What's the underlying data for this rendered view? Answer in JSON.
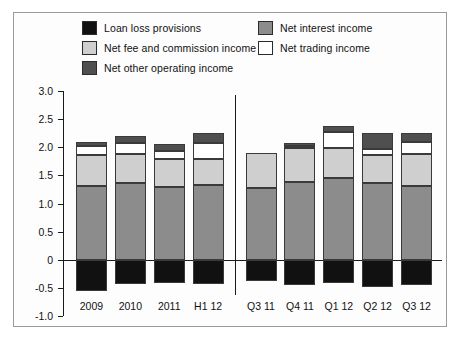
{
  "chart_data": {
    "type": "bar",
    "subtype": "stacked-bar-with-negative",
    "title": "",
    "xlabel": "",
    "ylabel": "",
    "ylim": [
      -1.0,
      3.0
    ],
    "yticks": [
      "3.0",
      "2.5",
      "2.0",
      "1.5",
      "1.0",
      "0.5",
      "0",
      "-0.5",
      "-1.0"
    ],
    "ytick_values": [
      3.0,
      2.5,
      2.0,
      1.5,
      1.0,
      0.5,
      0,
      -0.5,
      -1.0
    ],
    "grid": false,
    "legend_position": "top",
    "categories": [
      "2009",
      "2010",
      "2011",
      "H1 12",
      "Q3 11",
      "Q4 11",
      "Q1 12",
      "Q2 12",
      "Q3 12"
    ],
    "panel_divider_after_category": "H1 12",
    "series": [
      {
        "name": "Loan loss provisions",
        "color": "#111111",
        "values": [
          -0.55,
          -0.43,
          -0.42,
          -0.43,
          -0.38,
          -0.45,
          -0.42,
          -0.48,
          -0.45
        ]
      },
      {
        "name": "Net interest income",
        "color": "#8c8c8c",
        "values": [
          1.32,
          1.36,
          1.3,
          1.33,
          1.28,
          1.38,
          1.46,
          1.36,
          1.32
        ]
      },
      {
        "name": "Net fee and commission income",
        "color": "#cfcfcf",
        "values": [
          0.55,
          0.52,
          0.5,
          0.47,
          0.62,
          0.6,
          0.52,
          0.5,
          0.56
        ]
      },
      {
        "name": "Net trading income",
        "color": "#ffffff",
        "values": [
          0.15,
          0.2,
          0.14,
          0.28,
          0.0,
          0.04,
          0.29,
          0.11,
          0.21
        ]
      },
      {
        "name": "Net other operating income",
        "color": "#4f4f4f",
        "values": [
          0.08,
          0.12,
          0.11,
          0.17,
          0.0,
          0.06,
          0.1,
          0.28,
          0.16
        ]
      }
    ],
    "totals_positive": [
      2.1,
      2.2,
      2.05,
      2.25,
      1.9,
      2.08,
      2.37,
      2.25,
      2.25
    ]
  },
  "legend": {
    "items": [
      {
        "label": "Loan loss provisions",
        "color": "#111111"
      },
      {
        "label": "Net interest income",
        "color": "#8c8c8c"
      },
      {
        "label": "Net fee and commission income",
        "color": "#cfcfcf"
      },
      {
        "label": "Net trading income",
        "color": "#ffffff"
      },
      {
        "label": "Net other operating income",
        "color": "#4f4f4f"
      }
    ]
  }
}
